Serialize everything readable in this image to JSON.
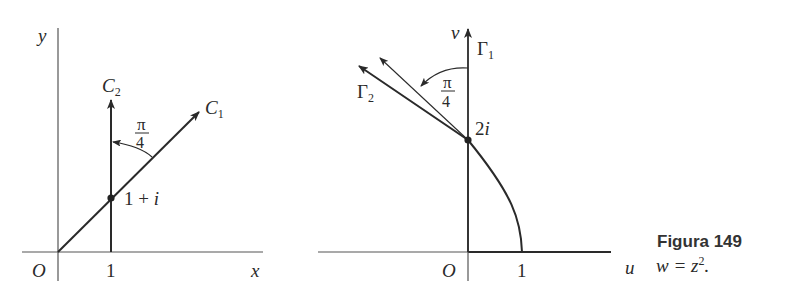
{
  "figure": {
    "number_label": "Figura 149",
    "formula": "w = z",
    "formula_exponent": "2",
    "formula_end": "."
  },
  "left_plot": {
    "x_axis_label": "x",
    "y_axis_label": "y",
    "origin_label": "O",
    "x_tick_label": "1",
    "curve_c1_label": "C",
    "curve_c1_sub": "1",
    "curve_c2_label": "C",
    "curve_c2_sub": "2",
    "point_label": "1 + i",
    "angle_num": "π",
    "angle_den": "4"
  },
  "right_plot": {
    "u_axis_label": "u",
    "v_axis_label": "v",
    "origin_label": "O",
    "u_tick_label": "1",
    "gamma1_label": "Γ",
    "gamma1_sub": "1",
    "gamma2_label": "Γ",
    "gamma2_sub": "2",
    "point_label": "2i",
    "angle_num": "π",
    "angle_den": "4"
  },
  "colors": {
    "ink": "#2a2a2a",
    "axis": "#555555",
    "background": "#ffffff"
  }
}
